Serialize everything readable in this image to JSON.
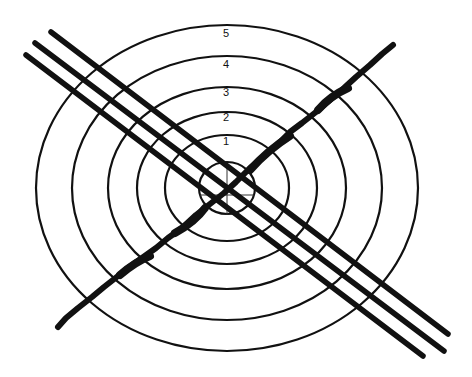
{
  "diagram": {
    "ring_labels": [
      "1",
      "2",
      "3",
      "4",
      "5"
    ],
    "colors": {
      "stroke": "#111111",
      "background": "#ffffff"
    }
  }
}
